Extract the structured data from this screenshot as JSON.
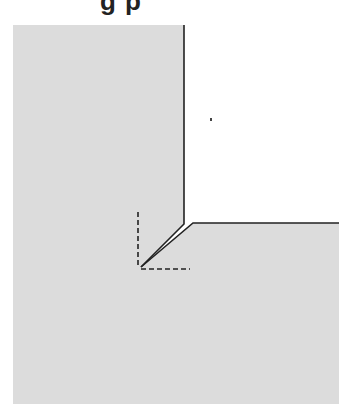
{
  "figure": {
    "title_fragment": "g p",
    "colors": {
      "fill": "#dcdcdc",
      "edge": "#222222",
      "background": "#ffffff",
      "dash": "#222222"
    },
    "shape": {
      "description": "L-shaped gray region with an inside corner crack (notch) and a dashed right-angle reference",
      "outer_points": [
        [
          13,
          25
        ],
        [
          184,
          25
        ],
        [
          184,
          200
        ],
        [
          141,
          267
        ],
        [
          193,
          223
        ],
        [
          339,
          223
        ],
        [
          339,
          404
        ],
        [
          13,
          404
        ]
      ]
    },
    "dashed_angle": {
      "vertical": {
        "x": 138,
        "y1": 212,
        "y2": 268
      },
      "horizontal": {
        "y": 269,
        "x1": 141,
        "x2": 190
      }
    }
  }
}
